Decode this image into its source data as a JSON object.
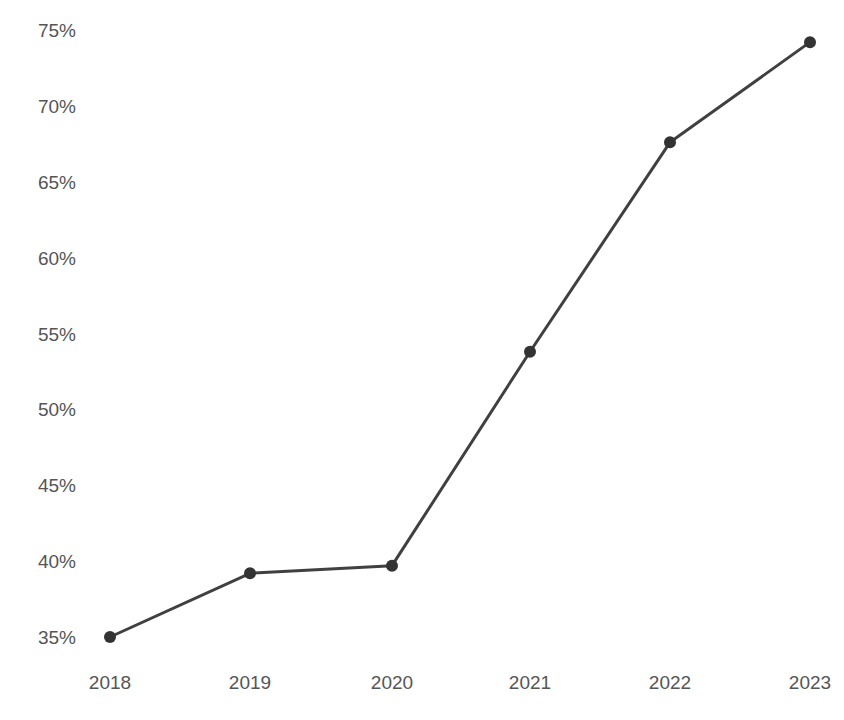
{
  "chart_data": {
    "type": "line",
    "title": "",
    "subtitle": "",
    "xlabel": "",
    "ylabel": "",
    "categories": [
      "2018",
      "2019",
      "2020",
      "2021",
      "2022",
      "2023"
    ],
    "series": [
      {
        "name": "",
        "values": [
          35.0,
          39.2,
          39.7,
          53.8,
          67.6,
          74.2
        ]
      }
    ],
    "x": [
      2018,
      2019,
      2020,
      2021,
      2022,
      2023
    ],
    "values": [
      35.0,
      39.2,
      39.7,
      53.8,
      67.6,
      74.2
    ],
    "value_suffix": "%",
    "ylim": [
      35,
      75
    ],
    "xlim": [
      2018,
      2023
    ],
    "y_ticks": [
      35,
      40,
      45,
      50,
      55,
      60,
      65,
      70,
      75
    ],
    "y_tick_labels": [
      "35%",
      "40%",
      "45%",
      "50%",
      "55%",
      "60%",
      "65%",
      "70%",
      "75%"
    ],
    "x_ticks": [
      2018,
      2019,
      2020,
      2021,
      2022,
      2023
    ],
    "x_tick_labels": [
      "2018",
      "2019",
      "2020",
      "2021",
      "2022",
      "2023"
    ],
    "grid": false,
    "legend": false,
    "legend_position": "none",
    "line_color": "#404040",
    "marker_color": "#333333",
    "marker_style": "circle",
    "tick_label_color": "#555555",
    "background_color": "#ffffff",
    "annotations": []
  },
  "axes": {
    "y_tick_labels": [
      "75%",
      "70%",
      "65%",
      "60%",
      "55%",
      "50%",
      "45%",
      "40%",
      "35%"
    ],
    "x_tick_labels": [
      "2018",
      "2019",
      "2020",
      "2021",
      "2022",
      "2023"
    ]
  }
}
